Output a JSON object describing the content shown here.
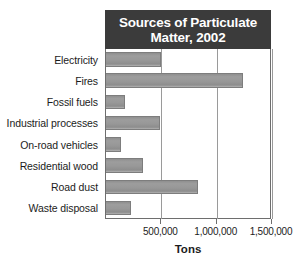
{
  "chart_data": {
    "type": "bar",
    "orientation": "horizontal",
    "title": "Sources of Particulate Matter, 2002",
    "title_lines": [
      "Sources of Particulate",
      "Matter, 2002"
    ],
    "xlabel": "Tons",
    "ylabel": "",
    "categories": [
      "Electricity",
      "Fires",
      "Fossil fuels",
      "Industrial processes",
      "On-road vehicles",
      "Residential wood",
      "Road dust",
      "Waste disposal"
    ],
    "values": [
      500000,
      1235000,
      173000,
      490000,
      136000,
      336000,
      827000,
      227000
    ],
    "xlim": [
      0,
      1500000
    ],
    "xticks": [
      500000,
      1000000,
      1500000
    ],
    "xticklabels": [
      "500,000",
      "1,000,000",
      "1,500,000"
    ],
    "grid": true,
    "grid_axis": "x",
    "legend": false,
    "bar_color": "#989898",
    "title_background": "#3b3b3b",
    "title_color": "#ffffff",
    "axis_color": "#6e6e6e",
    "gridline_color": "#9a9a9a",
    "text_color": "#1c1c1c"
  }
}
